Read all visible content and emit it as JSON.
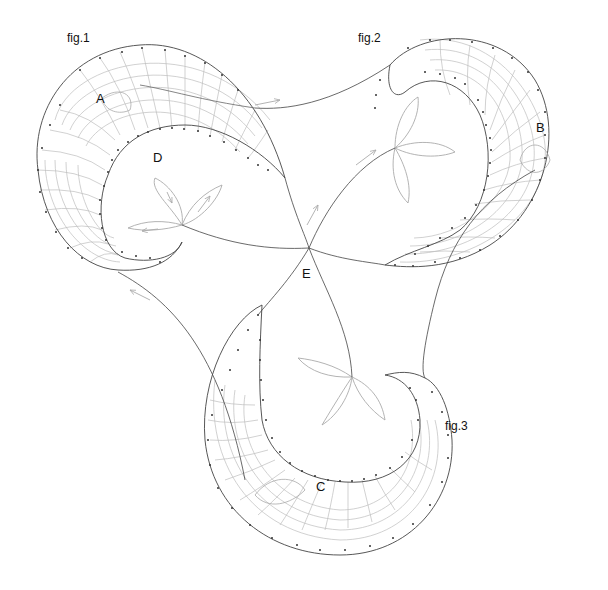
{
  "diagram": {
    "figures": [
      {
        "id": "fig1",
        "label": "fig.1"
      },
      {
        "id": "fig2",
        "label": "fig.2"
      },
      {
        "id": "fig3",
        "label": "fig.3"
      }
    ],
    "points": {
      "A": "A",
      "B": "B",
      "C": "C",
      "D": "D",
      "E": "E"
    },
    "colors": {
      "outline": "#444444",
      "grid": "#b8b8b8",
      "leaf": "#aaaaaa",
      "background": "#ffffff"
    }
  }
}
